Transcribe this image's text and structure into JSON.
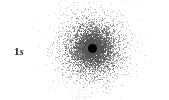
{
  "figure": {
    "type": "electron-density-dot-plot",
    "title": "1s",
    "width": 169,
    "height": 100,
    "background_color": "#ffffff"
  },
  "label": {
    "text": "1s",
    "principal_quantum_number": "1",
    "subshell": "s",
    "x": 14,
    "y": 48,
    "color": "#1a1a1a"
  },
  "nucleus": {
    "name": "nucleus-dot",
    "x": 92,
    "y": 48,
    "diameter": 9,
    "color": "#000000"
  },
  "chart_data": {
    "type": "scatter",
    "title": "1s",
    "xlabel": "",
    "ylabel": "",
    "center": [
      92,
      48
    ],
    "n_points": 5200,
    "radial_decay": 13.5,
    "max_radius": 78,
    "dot_size": 1,
    "dot_color": "#555555",
    "legend": "none",
    "grid": false
  }
}
